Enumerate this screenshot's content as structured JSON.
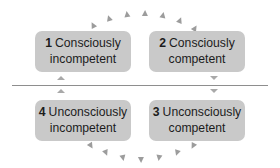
{
  "diagram": {
    "background_color": "#ffffff",
    "box_fill_color": "#c9c9c9",
    "text_color": "#1c1c1c",
    "marker_color": "#9c9c9c",
    "divider_color": "#8e8e8e"
  },
  "stages": [
    {
      "number": "1",
      "line1": "Consciously",
      "line2": "incompetent",
      "position": "top-left"
    },
    {
      "number": "2",
      "line1": "Consciously",
      "line2": "competent",
      "position": "top-right"
    },
    {
      "number": "3",
      "line1": "Unconsciously",
      "line2": "competent",
      "position": "bottom-right"
    },
    {
      "number": "4",
      "line1": "Unconsciously",
      "line2": "incompetent",
      "position": "bottom-left"
    }
  ],
  "divider_markers": [
    {
      "name": "left-above-divider",
      "direction": "up"
    },
    {
      "name": "left-below-divider",
      "direction": "up"
    },
    {
      "name": "right-above-divider",
      "direction": "down"
    },
    {
      "name": "right-below-divider",
      "direction": "down"
    }
  ],
  "arcs": {
    "top": {
      "name": "top-arc-flow",
      "direction": "left-to-right",
      "markers": [
        {
          "x": 90,
          "y": 22,
          "rot": 152
        },
        {
          "x": 106,
          "y": 15,
          "rot": 162
        },
        {
          "x": 124,
          "y": 11,
          "rot": 172
        },
        {
          "x": 142,
          "y": 10,
          "rot": 182
        },
        {
          "x": 160,
          "y": 12,
          "rot": 192
        },
        {
          "x": 177,
          "y": 17,
          "rot": 202
        },
        {
          "x": 192,
          "y": 25,
          "rot": 212
        }
      ]
    },
    "bottom": {
      "name": "bottom-arc-flow",
      "direction": "right-to-left",
      "markers": [
        {
          "x": 190,
          "y": 143,
          "rot": 28
        },
        {
          "x": 174,
          "y": 150,
          "rot": 18
        },
        {
          "x": 156,
          "y": 155,
          "rot": 8
        },
        {
          "x": 138,
          "y": 157,
          "rot": 358
        },
        {
          "x": 120,
          "y": 155,
          "rot": 348
        },
        {
          "x": 103,
          "y": 150,
          "rot": 338
        },
        {
          "x": 88,
          "y": 143,
          "rot": 328
        }
      ]
    }
  }
}
